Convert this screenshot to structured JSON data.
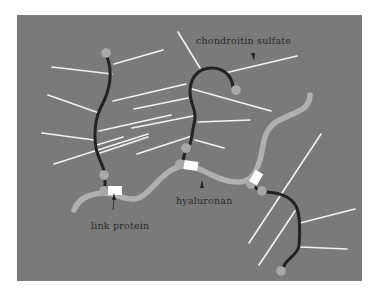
{
  "figure": {
    "background_color": "#ffffff",
    "panel_color": "#7a7a7a"
  },
  "labels": {
    "chondroitin_sulfate": "chondroitin sulfate",
    "hyaluronan": "hyaluronan",
    "link_protein": "link protein"
  },
  "colors": {
    "core_protein": "#222222",
    "hyaluronan": "#b0b0b0",
    "chondroitin_sulfate": "#f2f2f2",
    "link_protein": "#ffffff",
    "globular_domain": "#a8a8a8",
    "label_text": "#2a2a2a"
  },
  "components": [
    {
      "name": "hyaluronan backbone",
      "count": 1
    },
    {
      "name": "core protein",
      "count": 3
    },
    {
      "name": "link protein",
      "count": 3
    },
    {
      "name": "chondroitin sulfate chains",
      "count": 20
    }
  ]
}
